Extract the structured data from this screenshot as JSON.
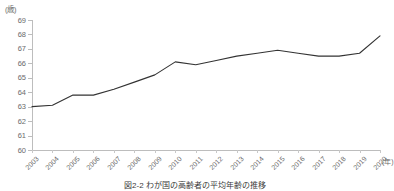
{
  "chart_data": {
    "type": "line",
    "title": "",
    "xlabel": "(年)",
    "ylabel": "(歳)",
    "x_unit": "(年)",
    "y_unit": "(歳)",
    "categories": [
      "2003",
      "2004",
      "2005",
      "2006",
      "2007",
      "2008",
      "2009",
      "2010",
      "2011",
      "2012",
      "2013",
      "2014",
      "2015",
      "2016",
      "2017",
      "2018",
      "2019",
      "2020"
    ],
    "values": [
      63.0,
      63.1,
      63.8,
      63.8,
      64.2,
      64.7,
      65.2,
      66.1,
      65.9,
      66.2,
      66.5,
      66.7,
      66.9,
      66.7,
      66.5,
      66.5,
      66.7,
      67.9
    ],
    "series": [
      {
        "name": "平均引退年齢",
        "values": [
          63.0,
          63.1,
          63.8,
          63.8,
          64.2,
          64.7,
          65.2,
          66.1,
          65.9,
          66.2,
          66.5,
          66.7,
          66.9,
          66.7,
          66.5,
          66.5,
          66.7,
          67.9
        ]
      }
    ],
    "ylim": [
      60,
      69
    ],
    "yticks": [
      60,
      61,
      62,
      63,
      64,
      65,
      66,
      67,
      68,
      69
    ],
    "ytick_labels": [
      "60",
      "61",
      "62",
      "63",
      "64",
      "65",
      "66",
      "67",
      "68",
      "69"
    ],
    "xlim": [
      "2003",
      "2020"
    ],
    "grid": false,
    "legend": "none",
    "line_color": "#333333",
    "axis_color": "#bdbdbd",
    "text_color": "#6b6b6b"
  },
  "caption": {
    "text": "図2-2  わが国の高齢者の平均年齢の推移"
  }
}
